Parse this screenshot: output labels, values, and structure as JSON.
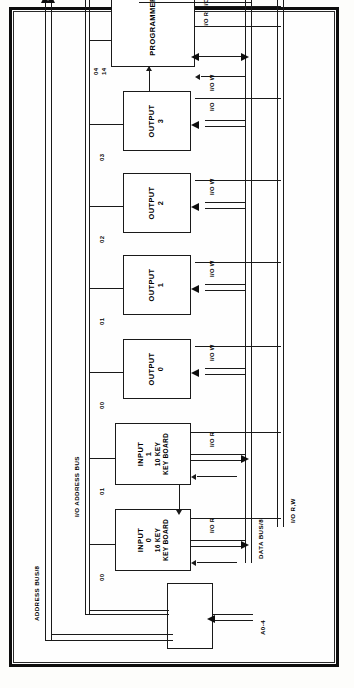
{
  "diagram": {
    "orientation": "rotated-90",
    "blocks": [
      {
        "id": "programmer",
        "label": "PROGRAMMER",
        "line2": "",
        "line3": "",
        "line4": "",
        "pin": "04\n14"
      },
      {
        "id": "output3",
        "label": "OUTPUT",
        "line2": "3",
        "line3": "",
        "line4": "",
        "pin": "03"
      },
      {
        "id": "output2",
        "label": "OUTPUT",
        "line2": "2",
        "line3": "",
        "line4": "",
        "pin": "02"
      },
      {
        "id": "output1",
        "label": "OUTPUT",
        "line2": "1",
        "line3": "",
        "line4": "",
        "pin": "01"
      },
      {
        "id": "output0",
        "label": "OUTPUT",
        "line2": "0",
        "line3": "",
        "line4": "",
        "pin": "00"
      },
      {
        "id": "input1",
        "label": "INPUT",
        "line2": "1",
        "line3": "10 KEY",
        "line4": "KEY BOARD",
        "pin": "01"
      },
      {
        "id": "input0",
        "label": "INPUT",
        "line2": "0",
        "line3": "16 KEY",
        "line4": "KEY BOARD",
        "pin": "00"
      },
      {
        "id": "decoder",
        "label": "",
        "line2": "",
        "line3": "",
        "line4": "",
        "pin": ""
      }
    ],
    "blocks_text": {
      "programmer": "PROGRAMMER",
      "output3_l1": "OUTPUT",
      "output3_l2": "3",
      "output2_l1": "OUTPUT",
      "output2_l2": "2",
      "output1_l1": "OUTPUT",
      "output1_l2": "1",
      "output0_l1": "OUTPUT",
      "output0_l2": "0",
      "input1_l1": "INPUT",
      "input1_l2": "1",
      "input1_l3": "10 KEY",
      "input1_l4": "KEY BOARD",
      "input0_l1": "INPUT",
      "input0_l2": "0",
      "input0_l3": "16 KEY",
      "input0_l4": "KEY BOARD"
    },
    "pins": {
      "programmer_a": "04",
      "programmer_b": "14",
      "output3": "03",
      "output2": "02",
      "output1": "01",
      "output0": "00",
      "input1": "01",
      "input0": "00"
    },
    "buses": {
      "address_bus": "ADDRESS BUS/8",
      "io_address_bus": "I/O ADDRESS BUS",
      "data_bus": "DATA BUS/8",
      "io_rw": "I/O R,W",
      "address_lines": "A0-4"
    },
    "signals": {
      "io_r_top": "I/O R",
      "io_w_top": "I/O W",
      "io_w_prog": "I/O W",
      "io_out3": "I/O",
      "io_w_out2": "I/O W",
      "io_w_out1": "I/O W",
      "io_w_out0": "I/O W",
      "io_r_in1": "I/O R",
      "io_r_in0": "I/O R"
    },
    "colors": {
      "ink": "#1a1a1a",
      "frame": "#0d0d0d",
      "paper": "#fefefe"
    }
  }
}
